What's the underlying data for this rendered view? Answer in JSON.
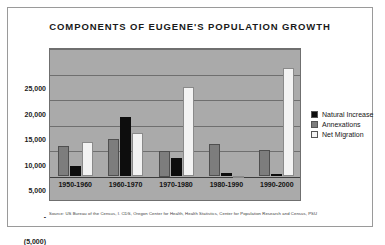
{
  "chart_data": {
    "type": "bar",
    "title": "COMPONENTS OF EUGENE'S POPULATION GROWTH",
    "xlabel": "",
    "ylabel": "",
    "ylim": [
      -5000,
      25000
    ],
    "grid": true,
    "legend_position": "right",
    "categories": [
      "1950-1960",
      "1960-1970",
      "1970-1980",
      "1980-1990",
      "1990-2000"
    ],
    "ytick_labels": [
      "25,000",
      "20,000",
      "15,000",
      "10,000",
      "5,000",
      "-",
      "(5,000)"
    ],
    "ytick_values": [
      25000,
      20000,
      15000,
      10000,
      5000,
      0,
      -5000
    ],
    "series": [
      {
        "name": "Natural Increase",
        "color": "#0d0d0d",
        "values": [
          2000,
          11700,
          3600,
          700,
          400
        ]
      },
      {
        "name": "Annexations",
        "color": "#7d7d7d",
        "values": [
          6000,
          7300,
          5000,
          6300,
          5100
        ]
      },
      {
        "name": "Net Migration",
        "color": "#f3f3f3",
        "values": [
          6800,
          8600,
          17600,
          100,
          21300
        ]
      }
    ],
    "series_draw_order": [
      "Annexations",
      "Natural Increase",
      "Net Migration"
    ],
    "source": "Source: US Bureau of the Census, I. CDS, Oregon Center for Health, Health Statistics, Center for Population Research and Census, PSU",
    "plot_background": "#aaaaaa"
  }
}
